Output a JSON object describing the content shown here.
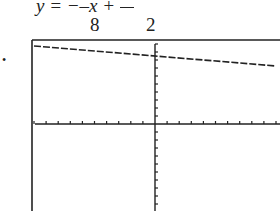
{
  "equation": {
    "text": "y = −−x + —",
    "lhs": "y",
    "denominators": [
      "8",
      "2"
    ]
  },
  "bullet": "•",
  "chart_data": {
    "type": "line",
    "xlabel": "",
    "ylabel": "",
    "xlim": [
      -10,
      10
    ],
    "ylim": [
      -10,
      10
    ],
    "x_ticks_per_side": 10,
    "y_ticks_per_side": 10,
    "grid": false,
    "series": [
      {
        "name": "line",
        "x": [
          -10,
          10
        ],
        "y": [
          3.75,
          1.25
        ]
      }
    ],
    "y_intercept": 2.5,
    "slope_denominator": 8,
    "intercept_denominator": 2
  },
  "colors": {
    "ink": "#222222",
    "background": "#ffffff"
  }
}
